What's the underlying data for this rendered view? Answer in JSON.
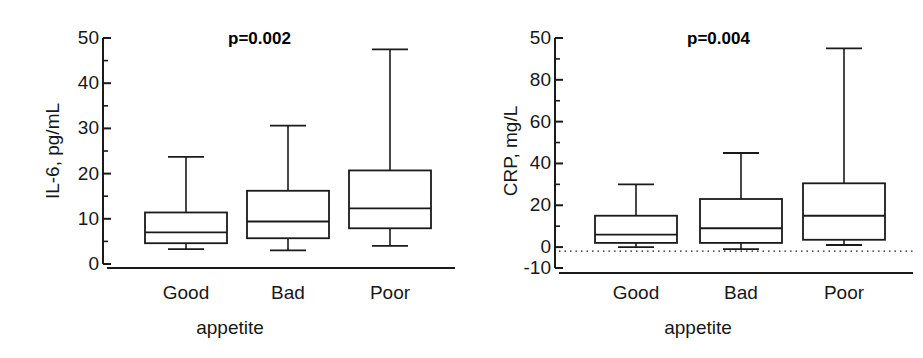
{
  "figure": {
    "background": "#ffffff",
    "line_color": "#1a1a1a",
    "panels": 2
  },
  "chart_data": [
    {
      "type": "boxplot",
      "panel_id": "il6",
      "title": "",
      "xlabel": "appetite",
      "ylabel": "IL-6, pg/mL",
      "categories": [
        "Good",
        "Bad",
        "Poor"
      ],
      "ylim": [
        0,
        50
      ],
      "yticks": [
        0,
        10,
        20,
        30,
        40,
        50
      ],
      "ytick_labels": [
        "0",
        "10",
        "20",
        "30",
        "40",
        "50"
      ],
      "minor_tick_step": 5,
      "grid": false,
      "legend": "none",
      "annotations": [
        {
          "text": "p=0.002",
          "kind": "p-value"
        }
      ],
      "boxes": [
        {
          "category": "Good",
          "whisker_low": 3.3,
          "q1": 4.6,
          "median": 7.0,
          "q3": 11.4,
          "whisker_high": 23.7
        },
        {
          "category": "Bad",
          "whisker_low": 3.0,
          "q1": 5.7,
          "median": 9.4,
          "q3": 16.2,
          "whisker_high": 30.6
        },
        {
          "category": "Poor",
          "whisker_low": 4.0,
          "q1": 7.9,
          "median": 12.3,
          "q3": 20.7,
          "whisker_high": 47.5
        }
      ]
    },
    {
      "type": "boxplot",
      "panel_id": "crp",
      "title": "",
      "xlabel": "appetite",
      "ylabel": "CRP, mg/L",
      "categories": [
        "Good",
        "Bad",
        "Poor"
      ],
      "ylim": [
        -10,
        100
      ],
      "yticks": [
        -10,
        0,
        20,
        40,
        60,
        80,
        100
      ],
      "ytick_labels": [
        "-10",
        "0",
        "20",
        "40",
        "60",
        "80",
        "50"
      ],
      "minor_tick_step": 10,
      "grid": false,
      "zero_reference_line": 0,
      "legend": "none",
      "annotations": [
        {
          "text": "p=0.004",
          "kind": "p-value"
        }
      ],
      "boxes": [
        {
          "category": "Good",
          "whisker_low": 0.0,
          "q1": 2.0,
          "median": 6.0,
          "q3": 15.0,
          "whisker_high": 30.0
        },
        {
          "category": "Bad",
          "whisker_low": -1.0,
          "q1": 2.0,
          "median": 9.0,
          "q3": 23.0,
          "whisker_high": 45.0
        },
        {
          "category": "Poor",
          "whisker_low": 1.0,
          "q1": 3.5,
          "median": 15.0,
          "q3": 30.5,
          "whisker_high": 95.0
        }
      ]
    }
  ]
}
